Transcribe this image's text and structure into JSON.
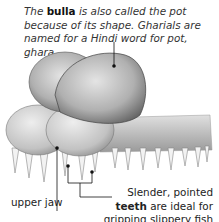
{
  "annotations": {
    "bulla": {
      "prefix": "The ",
      "term": "bulla",
      "text": " is also called the pot because of its shape. Gharials are named for a Hindi word for pot, ghara."
    },
    "upper_jaw": {
      "label": "upper jaw"
    },
    "teeth": {
      "prefix": "Slender, pointed ",
      "term": "teeth",
      "text": " are ideal for gripping slippery fish prey."
    }
  },
  "illustration": {
    "subject": "gharial snout with bulla",
    "colors": {
      "light": "#d9d9d9",
      "mid": "#a8a8a8",
      "dark": "#6b6b6b",
      "line": "#111111"
    }
  }
}
